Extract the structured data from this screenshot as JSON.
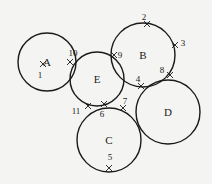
{
  "diagram": {
    "circles": [
      {
        "id": "A",
        "label": "A",
        "cx": 47,
        "cy": 62,
        "r": 29
      },
      {
        "id": "B",
        "label": "B",
        "cx": 143,
        "cy": 55,
        "r": 32
      },
      {
        "id": "C",
        "label": "C",
        "cx": 109,
        "cy": 140,
        "r": 32
      },
      {
        "id": "D",
        "label": "D",
        "cx": 168,
        "cy": 112,
        "r": 32
      },
      {
        "id": "E",
        "label": "E",
        "cx": 97,
        "cy": 79,
        "r": 27
      }
    ],
    "points": [
      {
        "n": "1",
        "x": 43,
        "y": 64,
        "lx": 40,
        "ly": 78
      },
      {
        "n": "2",
        "x": 147,
        "y": 24,
        "lx": 144,
        "ly": 20
      },
      {
        "n": "3",
        "x": 175,
        "y": 45,
        "lx": 183,
        "ly": 46
      },
      {
        "n": "4",
        "x": 141,
        "y": 86,
        "lx": 138,
        "ly": 82
      },
      {
        "n": "5",
        "x": 109,
        "y": 168,
        "lx": 110,
        "ly": 160
      },
      {
        "n": "6",
        "x": 104,
        "y": 104,
        "lx": 102,
        "ly": 117
      },
      {
        "n": "7",
        "x": 123,
        "y": 108,
        "lx": 125,
        "ly": 104
      },
      {
        "n": "8",
        "x": 170,
        "y": 75,
        "lx": 162,
        "ly": 73
      },
      {
        "n": "9",
        "x": 114,
        "y": 55,
        "lx": 120,
        "ly": 58
      },
      {
        "n": "10",
        "x": 70,
        "y": 62,
        "lx": 73,
        "ly": 56
      },
      {
        "n": "11",
        "x": 88,
        "y": 106,
        "lx": 76,
        "ly": 114
      }
    ]
  }
}
